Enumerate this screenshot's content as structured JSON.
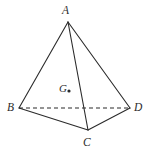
{
  "figure": {
    "name": "tetrahedron-with-centroid",
    "background_color": "#ffffff",
    "stroke_color": "#2b2b2b",
    "labels": {
      "apex": "A",
      "base_left": "B",
      "base_front": "C",
      "base_right": "D",
      "centroid": "G"
    },
    "vertices": {
      "A": {
        "x": 68,
        "y": 22
      },
      "B": {
        "x": 19,
        "y": 108
      },
      "C": {
        "x": 88,
        "y": 130
      },
      "D": {
        "x": 130,
        "y": 108
      },
      "G": {
        "x": 69,
        "y": 91
      }
    },
    "edges": [
      {
        "name": "edge-AB",
        "from": "A",
        "to": "B",
        "style": "solid"
      },
      {
        "name": "edge-AC",
        "from": "A",
        "to": "C",
        "style": "solid"
      },
      {
        "name": "edge-AD",
        "from": "A",
        "to": "D",
        "style": "solid"
      },
      {
        "name": "edge-BC",
        "from": "B",
        "to": "C",
        "style": "solid"
      },
      {
        "name": "edge-CD",
        "from": "C",
        "to": "D",
        "style": "solid"
      },
      {
        "name": "edge-BD",
        "from": "B",
        "to": "D",
        "style": "dashed"
      }
    ],
    "centroid_dot_radius": 1.6
  }
}
